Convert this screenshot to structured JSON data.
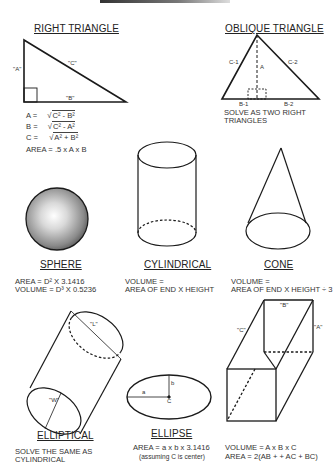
{
  "right_triangle": {
    "title": "RIGHT TRIANGLE",
    "labels": {
      "a": "\"A\"",
      "b": "\"B\"",
      "c": "\"C\""
    },
    "formulas": [
      {
        "lhs": "A =",
        "rad": "C² - B²"
      },
      {
        "lhs": "B =",
        "rad": "C² - A²"
      },
      {
        "lhs": "C =",
        "rad": "A² + B²"
      }
    ],
    "area": "AREA = .5 x A x B"
  },
  "oblique_triangle": {
    "title": "OBLIQUE TRIANGLE",
    "labels": {
      "c1": "C-1",
      "c2": "C-2",
      "a": "A",
      "b1": "B-1",
      "b2": "B-2"
    },
    "note_line1": "SOLVE AS TWO RIGHT",
    "note_line2": "TRIANGLES"
  },
  "sphere": {
    "title": "SPHERE",
    "area": "AREA = D² X 3.1416",
    "volume": "VOLUME = D³ X 0.5236"
  },
  "cylindrical": {
    "title": "CYLINDRICAL",
    "line1": "VOLUME =",
    "line2": "AREA OF END X HEIGHT"
  },
  "cone": {
    "title": "CONE",
    "line1": "VOLUME =",
    "line2": "AREA OF END X HEIGHT ÷ 3"
  },
  "elliptical": {
    "title": "ELLIPTICAL",
    "labels": {
      "l": "\"L\"",
      "w": "\"W\""
    },
    "line1": "SOLVE THE SAME AS",
    "line2": "CYLINDRICAL"
  },
  "ellipse": {
    "title": "ELLIPSE",
    "labels": {
      "a": "a",
      "b": "b",
      "c": "C"
    },
    "area": "AREA = a x b x 3.1416",
    "note": "(assuming C is center)"
  },
  "box": {
    "labels": {
      "a": "\"A\"",
      "b": "\"B\"",
      "c": "\"C\""
    },
    "volume": "VOLUME = A  x  B  x  C",
    "area": "AREA = 2(AB + + AC + BC)"
  },
  "colors": {
    "line": "#1a1a1a",
    "text": "#333333",
    "sphere_light": "#ffffff",
    "sphere_dark": "#4a4a4a"
  }
}
